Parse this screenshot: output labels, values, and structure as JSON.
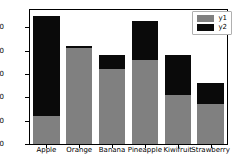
{
  "chart_data": {
    "type": "bar",
    "subtype": "stacked-bar",
    "title": "",
    "xlabel": "",
    "ylabel": "",
    "categories": [
      "Apple",
      "Orange",
      "Banana",
      "Pineapple",
      "Kiwifruit",
      "Strawberry"
    ],
    "series": [
      {
        "name": "y1",
        "color": "#808080",
        "values": [
          12,
          41,
          32,
          36,
          21,
          17
        ]
      },
      {
        "name": "y2",
        "color": "#0a0a0a",
        "values": [
          43,
          1,
          6,
          17,
          17,
          9
        ]
      }
    ],
    "totals": [
      55,
      42,
      38,
      53,
      38,
      26
    ],
    "ylim": [
      0,
      57.5
    ],
    "yticks": [
      0,
      10,
      20,
      30,
      40,
      50
    ],
    "ytick_labels": [
      "0",
      "10",
      "20",
      "30",
      "40",
      "50"
    ],
    "grid": false,
    "legend": {
      "position": "upper-right",
      "entries": [
        {
          "label": "y1",
          "color": "#808080"
        },
        {
          "label": "y2",
          "color": "#0a0a0a"
        }
      ]
    }
  }
}
